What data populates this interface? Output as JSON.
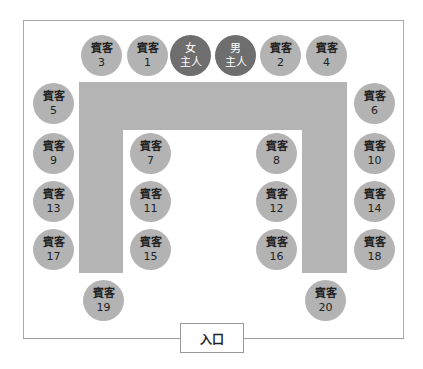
{
  "diagram": {
    "type": "u-shaped-banquet-seating",
    "colors": {
      "host_seat": "#6e6e6e",
      "guest_seat": "#b3b3b3",
      "table": "#b4b4b4",
      "border": "#a8a8a8"
    },
    "entrance_label": "入口",
    "seats": [
      {
        "id": "guest-3",
        "kind": "guest",
        "role": "賓客",
        "num": "3",
        "x": 101,
        "y": 55
      },
      {
        "id": "guest-1",
        "kind": "guest",
        "role": "賓客",
        "num": "1",
        "x": 147,
        "y": 55
      },
      {
        "id": "hostess",
        "kind": "host",
        "role": "女",
        "num": "主人",
        "x": 190,
        "y": 55
      },
      {
        "id": "host",
        "kind": "host",
        "role": "男",
        "num": "主人",
        "x": 235,
        "y": 55
      },
      {
        "id": "guest-2",
        "kind": "guest",
        "role": "賓客",
        "num": "2",
        "x": 280,
        "y": 55
      },
      {
        "id": "guest-4",
        "kind": "guest",
        "role": "賓客",
        "num": "4",
        "x": 326,
        "y": 55
      },
      {
        "id": "guest-5",
        "kind": "guest",
        "role": "賓客",
        "num": "5",
        "x": 53,
        "y": 103
      },
      {
        "id": "guest-6",
        "kind": "guest",
        "role": "賓客",
        "num": "6",
        "x": 374,
        "y": 103
      },
      {
        "id": "guest-7",
        "kind": "guest",
        "role": "賓客",
        "num": "7",
        "x": 150,
        "y": 153
      },
      {
        "id": "guest-8",
        "kind": "guest",
        "role": "賓客",
        "num": "8",
        "x": 276,
        "y": 153
      },
      {
        "id": "guest-9",
        "kind": "guest",
        "role": "賓客",
        "num": "9",
        "x": 53,
        "y": 153
      },
      {
        "id": "guest-10",
        "kind": "guest",
        "role": "賓客",
        "num": "10",
        "x": 374,
        "y": 153
      },
      {
        "id": "guest-11",
        "kind": "guest",
        "role": "賓客",
        "num": "11",
        "x": 150,
        "y": 201
      },
      {
        "id": "guest-12",
        "kind": "guest",
        "role": "賓客",
        "num": "12",
        "x": 276,
        "y": 201
      },
      {
        "id": "guest-13",
        "kind": "guest",
        "role": "賓客",
        "num": "13",
        "x": 53,
        "y": 201
      },
      {
        "id": "guest-14",
        "kind": "guest",
        "role": "賓客",
        "num": "14",
        "x": 374,
        "y": 201
      },
      {
        "id": "guest-15",
        "kind": "guest",
        "role": "賓客",
        "num": "15",
        "x": 150,
        "y": 249
      },
      {
        "id": "guest-16",
        "kind": "guest",
        "role": "賓客",
        "num": "16",
        "x": 276,
        "y": 249
      },
      {
        "id": "guest-17",
        "kind": "guest",
        "role": "賓客",
        "num": "17",
        "x": 53,
        "y": 249
      },
      {
        "id": "guest-18",
        "kind": "guest",
        "role": "賓客",
        "num": "18",
        "x": 374,
        "y": 249
      },
      {
        "id": "guest-19",
        "kind": "guest",
        "role": "賓客",
        "num": "19",
        "x": 103,
        "y": 300
      },
      {
        "id": "guest-20",
        "kind": "guest",
        "role": "賓客",
        "num": "20",
        "x": 325,
        "y": 300
      }
    ]
  }
}
